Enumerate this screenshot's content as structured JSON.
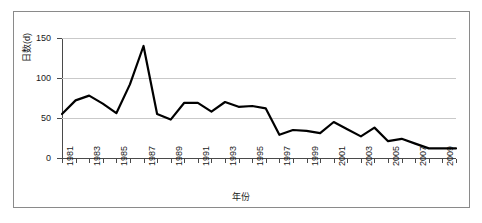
{
  "chart_data": {
    "type": "line",
    "title": "",
    "xlabel": "年份",
    "ylabel": "日数(d)",
    "xlim": [
      1981,
      2010
    ],
    "ylim": [
      0,
      150
    ],
    "grid": true,
    "legend": false,
    "y_ticks": [
      0,
      50,
      100,
      150
    ],
    "y_tick_labels": [
      "0",
      "50",
      "100",
      "150"
    ],
    "x_tick_labels": [
      "1981",
      "1983",
      "1985",
      "1987",
      "1989",
      "1991",
      "1993",
      "1995",
      "1997",
      "1999",
      "2001",
      "2003",
      "2005",
      "2007",
      "2009"
    ],
    "line_color": "#000000",
    "x": [
      1981,
      1982,
      1983,
      1984,
      1985,
      1986,
      1987,
      1988,
      1989,
      1990,
      1991,
      1992,
      1993,
      1994,
      1995,
      1996,
      1997,
      1998,
      1999,
      2000,
      2001,
      2002,
      2003,
      2004,
      2005,
      2006,
      2007,
      2008,
      2009,
      2010
    ],
    "values": [
      55,
      72,
      78,
      68,
      56,
      92,
      140,
      55,
      48,
      69,
      69,
      58,
      70,
      64,
      65,
      62,
      29,
      35,
      34,
      31,
      45,
      36,
      27,
      38,
      21,
      24,
      18,
      12,
      12,
      12
    ],
    "series": [
      {
        "name": "日数",
        "values": [
          55,
          72,
          78,
          68,
          56,
          92,
          140,
          55,
          48,
          69,
          69,
          58,
          70,
          64,
          65,
          62,
          29,
          35,
          34,
          31,
          45,
          36,
          27,
          38,
          21,
          24,
          18,
          12,
          12,
          12
        ]
      }
    ]
  }
}
